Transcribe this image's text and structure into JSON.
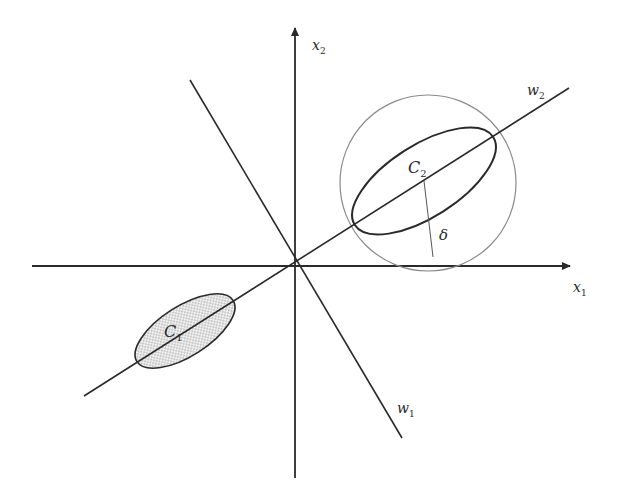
{
  "diagram": {
    "type": "linear-discriminant-projection",
    "colors": {
      "line": "#2a2a2a",
      "circle": "#8a8a8a",
      "fill_dots": "#9a9a9a",
      "background": "#ffffff"
    },
    "axes": {
      "x1": {
        "label": "x",
        "subscript": "1"
      },
      "x2": {
        "label": "x",
        "subscript": "2"
      }
    },
    "lines": {
      "w1": {
        "label": "w",
        "subscript": "1"
      },
      "w2": {
        "label": "w",
        "subscript": "2"
      }
    },
    "clusters": {
      "c1": {
        "label": "C",
        "subscript": "1",
        "fill": "dotted"
      },
      "c2": {
        "label": "C",
        "subscript": "2",
        "fill": "none"
      }
    },
    "delta": {
      "label": "δ"
    }
  }
}
